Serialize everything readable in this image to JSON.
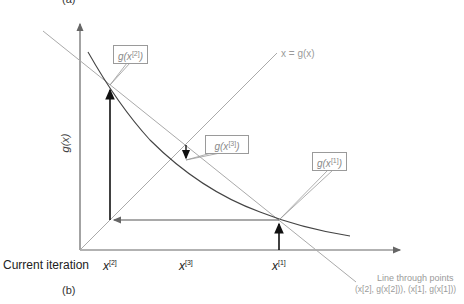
{
  "panel_labels": {
    "top": "(a)",
    "bottom": "(b)"
  },
  "axes": {
    "y_label": "g(x)",
    "x_row_label": "Current iteration",
    "x_ticks": [
      {
        "base": "x",
        "sup": "[2]"
      },
      {
        "base": "x",
        "sup": "[3]"
      },
      {
        "base": "x",
        "sup": "[1]"
      }
    ]
  },
  "lines": {
    "identity_label": "x = g(x)",
    "secant_label_line1": "Line through points",
    "secant_label_line2": "(x[2], g(x[2])), (x[1], g(x[1]))"
  },
  "callouts": [
    {
      "base": "g(x",
      "sup": "[2]",
      "end": ")"
    },
    {
      "base": "g(x",
      "sup": "[3]",
      "end": ")"
    },
    {
      "base": "g(x",
      "sup": "[1]",
      "end": ")"
    }
  ],
  "colors": {
    "axis": "#555555",
    "curve": "#444444",
    "guide": "#aaaaaa",
    "arrow": "#111111"
  }
}
